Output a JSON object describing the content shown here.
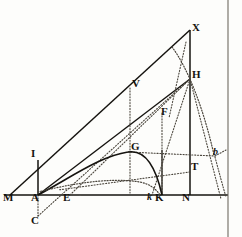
{
  "figure": {
    "width": 242,
    "height": 237,
    "background_color": "#fdfdfb",
    "ink_color": "#15130f",
    "dotted_color": "#4a453c"
  },
  "labels": {
    "M": "M",
    "A": "A",
    "E": "E",
    "k": "k",
    "K": "K",
    "N": "N",
    "C": "C",
    "I": "I",
    "G": "G",
    "V": "V",
    "F": "F",
    "T": "T",
    "H": "H",
    "X": "X",
    "b": "b"
  },
  "points": [
    {
      "name": "M",
      "label": "M",
      "x": 10,
      "y": 195,
      "label_x": 4,
      "label_y": 197,
      "style": "roman"
    },
    {
      "name": "A",
      "label": "A",
      "x": 38,
      "y": 195,
      "label_x": 32,
      "label_y": 197,
      "style": "roman"
    },
    {
      "name": "E",
      "label": "E",
      "x": 70,
      "y": 195,
      "label_x": 64,
      "label_y": 197,
      "style": "roman"
    },
    {
      "name": "k",
      "label": "k",
      "x": 152,
      "y": 195,
      "label_x": 148,
      "label_y": 197,
      "style": "italic"
    },
    {
      "name": "K",
      "label": "K",
      "x": 162,
      "y": 195,
      "label_x": 157,
      "label_y": 197,
      "style": "roman"
    },
    {
      "name": "N",
      "label": "N",
      "x": 190,
      "y": 195,
      "label_x": 184,
      "label_y": 197,
      "style": "roman"
    },
    {
      "name": "C",
      "label": "C",
      "x": 38,
      "y": 218,
      "label_x": 32,
      "label_y": 217,
      "style": "roman"
    },
    {
      "name": "I",
      "label": "I",
      "x": 38,
      "y": 162,
      "label_x": 32,
      "label_y": 152,
      "style": "roman"
    },
    {
      "name": "G",
      "label": "G",
      "x": 128,
      "y": 152,
      "label_x": 132,
      "label_y": 144,
      "style": "roman"
    },
    {
      "name": "V",
      "label": "V",
      "x": 130,
      "y": 88,
      "label_x": 133,
      "label_y": 80,
      "style": "roman"
    },
    {
      "name": "F",
      "label": "F",
      "x": 158,
      "y": 116,
      "label_x": 161,
      "label_y": 108,
      "style": "roman"
    },
    {
      "name": "T",
      "label": "T",
      "x": 190,
      "y": 172,
      "label_x": 191,
      "label_y": 163,
      "style": "roman"
    },
    {
      "name": "H",
      "label": "H",
      "x": 190,
      "y": 79,
      "label_x": 193,
      "label_y": 71,
      "style": "roman"
    },
    {
      "name": "X",
      "label": "X",
      "x": 190,
      "y": 30,
      "label_x": 193,
      "label_y": 24,
      "style": "roman"
    },
    {
      "name": "b",
      "label": "b",
      "x": 215,
      "y": 156,
      "label_x": 214,
      "label_y": 150,
      "style": "italic"
    }
  ],
  "solid_lines": [
    {
      "name": "baseline-MN-right-edge",
      "from": "M",
      "to": "plate-right",
      "x1": 4,
      "y1": 195,
      "x2": 228,
      "y2": 195
    },
    {
      "name": "line-M-X",
      "from": "M",
      "to": "X",
      "x1": 10,
      "y1": 195,
      "x2": 190,
      "y2": 30
    },
    {
      "name": "line-A-H",
      "from": "A",
      "to": "H",
      "x1": 38,
      "y1": 195,
      "x2": 190,
      "y2": 79
    },
    {
      "name": "line-A-I-vertical",
      "from": "A",
      "to": "I",
      "x1": 38,
      "y1": 195,
      "x2": 38,
      "y2": 160
    },
    {
      "name": "line-X-N-vertical",
      "from": "X",
      "to": "N",
      "x1": 190,
      "y1": 30,
      "x2": 190,
      "y2": 195
    },
    {
      "name": "line-K-F-vertical",
      "from": "K",
      "to": "F",
      "x1": 162,
      "y1": 195,
      "x2": 162,
      "y2": 113
    },
    {
      "name": "line-E-V-vertical",
      "from": "E",
      "to": "V",
      "x1": 130,
      "y1": 195,
      "x2": 130,
      "y2": 88
    },
    {
      "name": "plate-border-right",
      "from": "top",
      "to": "bottom",
      "x1": 228,
      "y1": 0,
      "x2": 228,
      "y2": 237
    }
  ],
  "dotted_lines": [
    {
      "name": "dotted-A-C",
      "x1": 38,
      "y1": 195,
      "x2": 38,
      "y2": 216
    },
    {
      "name": "dotted-C-H",
      "x1": 38,
      "y1": 216,
      "x2": 190,
      "y2": 79
    },
    {
      "name": "dotted-G-b",
      "x1": 128,
      "y1": 152,
      "x2": 215,
      "y2": 156
    },
    {
      "name": "dotted-A-F-H",
      "x1": 38,
      "y1": 195,
      "x2": 190,
      "y2": 79
    },
    {
      "name": "dotted-H-k",
      "x1": 190,
      "y1": 79,
      "x2": 152,
      "y2": 195
    },
    {
      "name": "dotted-H-b-down",
      "x1": 190,
      "y1": 79,
      "x2": 222,
      "y2": 200
    },
    {
      "name": "dotted-E-H-up",
      "x1": 70,
      "y1": 195,
      "x2": 190,
      "y2": 79
    },
    {
      "name": "dotted-T-lowleft",
      "x1": 190,
      "y1": 172,
      "x2": 60,
      "y2": 190
    },
    {
      "name": "dotted-V-down",
      "x1": 130,
      "y1": 88,
      "x2": 130,
      "y2": 193
    },
    {
      "name": "dotted-F-down",
      "x1": 162,
      "y1": 113,
      "x2": 162,
      "y2": 193
    },
    {
      "name": "dotted-X-down-left",
      "x1": 186,
      "y1": 40,
      "x2": 168,
      "y2": 120
    }
  ],
  "curves": [
    {
      "name": "solid-curve-A-G-K",
      "style": "solid",
      "path": "M 38 195 C 70 178, 100 156, 128 152 C 146 149, 156 168, 162 195"
    },
    {
      "name": "dotted-curve-A-k",
      "style": "dotted",
      "path": "M 38 192 C 70 184, 110 178, 140 182 C 150 184, 156 189, 160 195"
    },
    {
      "name": "dotted-curve-H-b",
      "style": "dotted",
      "path": "M 172 48 C 188 70, 204 110, 214 155"
    },
    {
      "name": "dotted-curve-b-tail",
      "style": "dotted",
      "path": "M 215 156 C 220 172, 224 186, 226 196"
    }
  ],
  "extra_marks": [
    {
      "name": "tick-after-E",
      "x": 80,
      "y": 196,
      "glyph": "·"
    }
  ]
}
